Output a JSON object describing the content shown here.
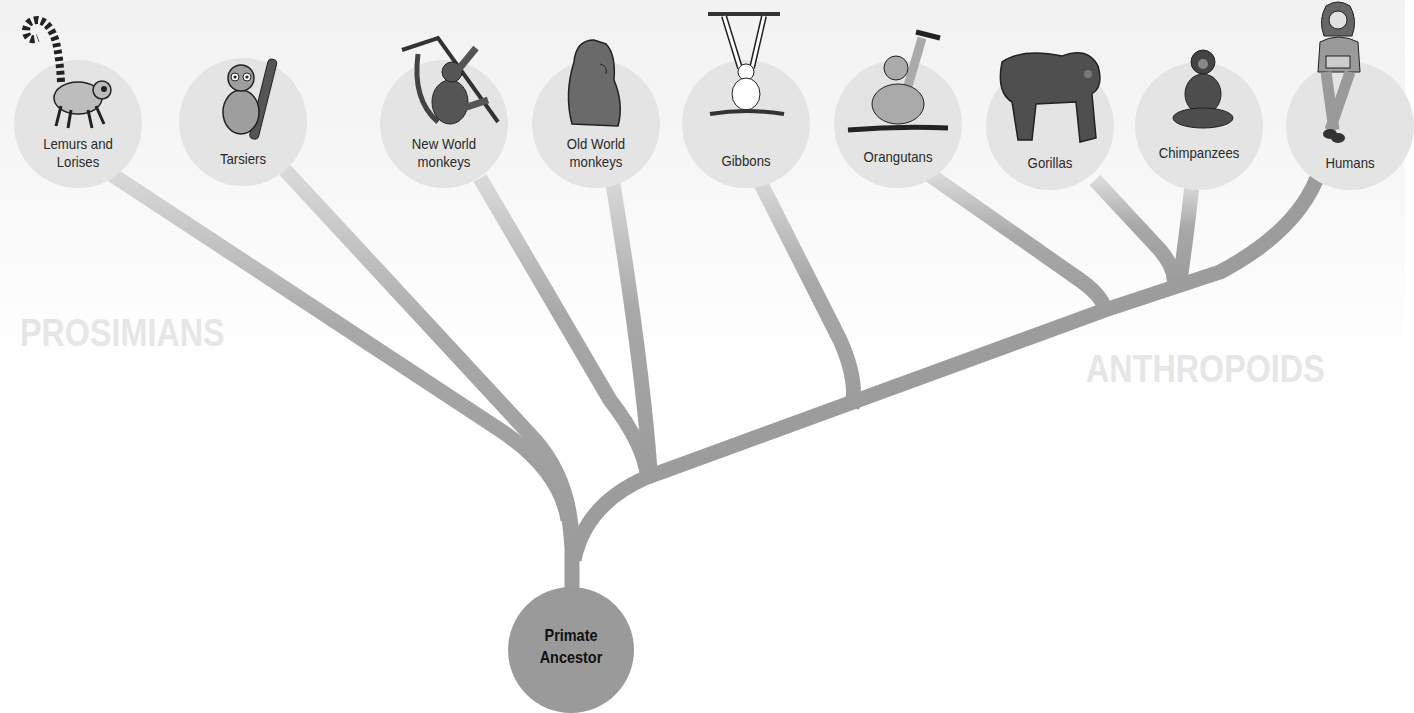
{
  "colors": {
    "branch": "#9c9c9c",
    "branch_faded": "#d8d8d8",
    "node_fill": "#e4e4e4",
    "root_fill": "#9a9a9a",
    "group_label": "#e6e6e6"
  },
  "root": {
    "label_line1": "Primate",
    "label_line2": "Ancestor"
  },
  "groups": {
    "prosimians": "PROSIMIANS",
    "anthropoids": "ANTHROPOIDS"
  },
  "taxa": [
    {
      "id": "lemurs",
      "line1": "Lemurs and",
      "line2": "Lorises",
      "icon": "lemur-icon"
    },
    {
      "id": "tarsiers",
      "line1": "Tarsiers",
      "line2": "",
      "icon": "tarsier-icon"
    },
    {
      "id": "new-world",
      "line1": "New World",
      "line2": "monkeys",
      "icon": "new-world-monkey-icon"
    },
    {
      "id": "old-world",
      "line1": "Old World",
      "line2": "monkeys",
      "icon": "old-world-monkey-icon"
    },
    {
      "id": "gibbons",
      "line1": "Gibbons",
      "line2": "",
      "icon": "gibbon-icon"
    },
    {
      "id": "orangutans",
      "line1": "Orangutans",
      "line2": "",
      "icon": "orangutan-icon"
    },
    {
      "id": "gorillas",
      "line1": "Gorillas",
      "line2": "",
      "icon": "gorilla-icon"
    },
    {
      "id": "chimpanzees",
      "line1": "Chimpanzees",
      "line2": "",
      "icon": "chimpanzee-icon"
    },
    {
      "id": "humans",
      "line1": "Humans",
      "line2": "",
      "icon": "human-icon"
    }
  ]
}
